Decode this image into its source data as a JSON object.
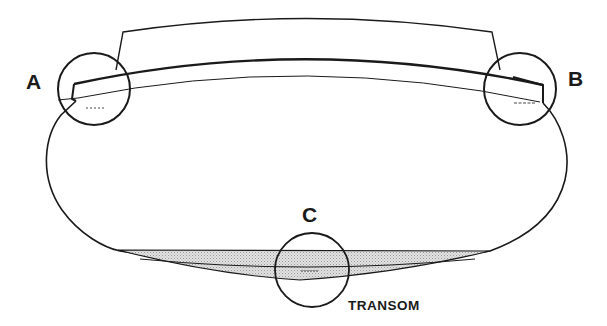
{
  "diagram": {
    "type": "boat hull cross-section (stern view) with detail callouts",
    "labels": {
      "a": "A",
      "b": "B",
      "c": "C",
      "transom": "TRANSOM"
    },
    "callouts": [
      {
        "id": "A",
        "location": "port deck-to-hull joint"
      },
      {
        "id": "B",
        "location": "starboard deck-to-hull joint"
      },
      {
        "id": "C",
        "location": "transom bottom"
      }
    ],
    "colors": {
      "stroke": "#1a1a1a",
      "shade": "#cfcfcf",
      "background": "#ffffff"
    }
  }
}
